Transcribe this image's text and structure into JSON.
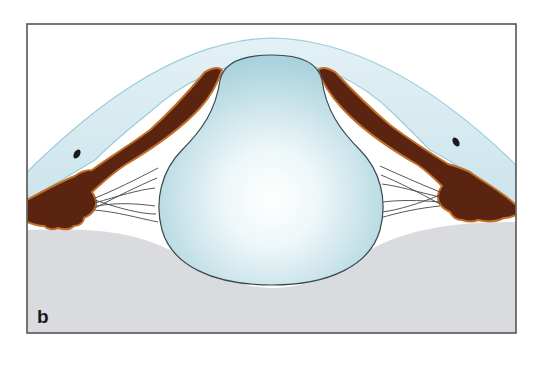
{
  "figure": {
    "panel_label": "b",
    "structures": [
      "cornea",
      "sclera",
      "iris",
      "ciliary-body",
      "zonular-fibers",
      "lens",
      "vitreous-body",
      "schlemm-canal"
    ],
    "colors": {
      "frame": "#555555",
      "cornea": "#d6ebf1",
      "cornea_edge": "#9ccbdb",
      "iris": "#5a2410",
      "iris_rim": "#c0702a",
      "lens_light": "#ffffff",
      "lens_dark": "#a9d2dc",
      "lens_edge": "#3a4a4f",
      "vitreous": "#d9dbde",
      "zonule": "#444444"
    }
  }
}
